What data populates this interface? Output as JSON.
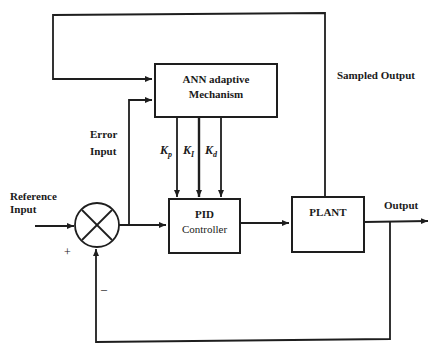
{
  "blocks": {
    "ann": {
      "line1": "ANN adaptive",
      "line2": "Mechanism"
    },
    "pid": {
      "line1": "PID",
      "line2": "Controller"
    },
    "plant": {
      "label": "PLANT"
    }
  },
  "gains": [
    {
      "symbol": "K",
      "sub": "p"
    },
    {
      "symbol": "K",
      "sub": "I"
    },
    {
      "symbol": "K",
      "sub": "d"
    }
  ],
  "labels": {
    "reference_input": [
      "Reference",
      "Input"
    ],
    "error_input": [
      "Error",
      "Input"
    ],
    "sampled_output": "Sampled Output",
    "output": "Output",
    "plus": "+",
    "minus": "–"
  },
  "colors": {
    "line": "#1e1e1e",
    "background": "#ffffff"
  }
}
